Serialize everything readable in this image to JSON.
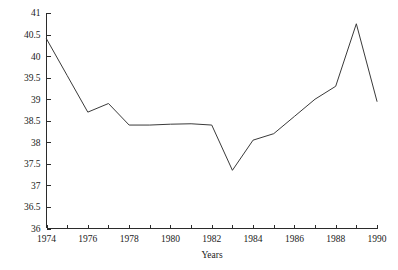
{
  "chart_data": {
    "type": "line",
    "title": "",
    "subtitle": "",
    "xlabel": "Years",
    "ylabel": "",
    "x": [
      1974,
      1975,
      1976,
      1977,
      1978,
      1979,
      1980,
      1981,
      1982,
      1983,
      1984,
      1985,
      1986,
      1987,
      1988,
      1989,
      1990
    ],
    "values": [
      40.4,
      39.55,
      38.7,
      38.9,
      38.4,
      38.4,
      38.42,
      38.43,
      38.4,
      37.35,
      38.05,
      38.2,
      38.6,
      39.0,
      39.3,
      40.75,
      38.95
    ],
    "series": [
      {
        "name": "series-1",
        "values": [
          40.4,
          39.55,
          38.7,
          38.9,
          38.4,
          38.4,
          38.42,
          38.43,
          38.4,
          37.35,
          38.05,
          38.2,
          38.6,
          39.0,
          39.3,
          40.75,
          38.95
        ]
      }
    ],
    "xlim": [
      1974,
      1990
    ],
    "ylim": [
      36,
      41
    ],
    "y_ticks": [
      36,
      36.5,
      37,
      37.5,
      38,
      38.5,
      39,
      39.5,
      40,
      40.5,
      41
    ],
    "y_tick_labels": [
      "36",
      "36.5",
      "37",
      "37.5",
      "38",
      "38.5",
      "39",
      "39.5",
      "40",
      "40.5",
      "41"
    ],
    "x_ticks": [
      1974,
      1975,
      1976,
      1977,
      1978,
      1979,
      1980,
      1981,
      1982,
      1983,
      1984,
      1985,
      1986,
      1987,
      1988,
      1989,
      1990
    ],
    "x_tick_labels": [
      "1974",
      "",
      "1976",
      "",
      "1978",
      "",
      "1980",
      "",
      "1982",
      "",
      "1984",
      "",
      "1986",
      "",
      "1988",
      "",
      "1990"
    ],
    "grid": false,
    "legend": false,
    "legend_position": "none",
    "markers": false,
    "line_color": "#3a3a3a",
    "background_color": "#ffffff",
    "axis_color": "#2b2b2b"
  }
}
